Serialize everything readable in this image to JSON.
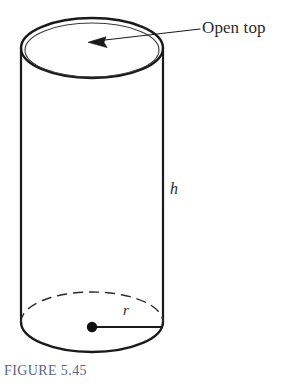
{
  "figure": {
    "caption": "FIGURE 5.45",
    "caption_color": "#5b6480",
    "background_color": "#ffffff",
    "stroke_color": "#1a1a1a",
    "thin_stroke_color": "#3a3a3a"
  },
  "annotations": {
    "open_top_label": "Open top",
    "height_label": "h",
    "radius_label": "r"
  },
  "shape": {
    "name": "open-top-cylinder",
    "top_ellipse": {
      "cx": 92,
      "cy": 48,
      "rx": 71,
      "ry": 30
    },
    "inner_top_ellipse": {
      "cx": 92,
      "cy": 50,
      "rx": 67,
      "ry": 27
    },
    "bottom_ellipse": {
      "cx": 92,
      "cy": 322,
      "rx": 71,
      "ry": 30
    },
    "left_wall_x": 21,
    "right_wall_x": 163,
    "center_dot": {
      "cx": 92,
      "cy": 327,
      "r": 5
    },
    "radius_line": {
      "x1": 92,
      "y1": 327,
      "x2": 162,
      "y2": 327
    },
    "leader_line": {
      "x1": 200,
      "y1": 29,
      "x2": 90,
      "y2": 42
    }
  }
}
